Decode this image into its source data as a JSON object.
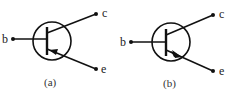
{
  "diagrams": [
    {
      "id": "a",
      "caption": "(a)",
      "terminals": {
        "base": "b",
        "collector": "c",
        "emitter": "e"
      },
      "arrow_direction": "inward",
      "type": "PNP transistor symbol"
    },
    {
      "id": "b",
      "caption": "(b)",
      "terminals": {
        "base": "b",
        "collector": "c",
        "emitter": "e"
      },
      "arrow_direction": "outward",
      "type": "NPN transistor symbol"
    }
  ],
  "colors": {
    "ink": "#111111",
    "background": "#ffffff"
  }
}
